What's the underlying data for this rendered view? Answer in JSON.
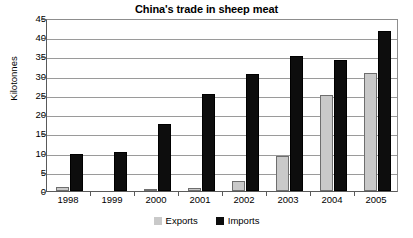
{
  "chart_data": {
    "type": "bar",
    "title": "China's trade in sheep meat",
    "xlabel": "",
    "ylabel": "Kilotonnes",
    "categories": [
      "1998",
      "1999",
      "2000",
      "2001",
      "2002",
      "2003",
      "2004",
      "2005"
    ],
    "series": [
      {
        "name": "Exports",
        "color": "#c9c9c9",
        "values": [
          1.0,
          0.0,
          0.6,
          0.9,
          2.5,
          9.0,
          25.0,
          30.6
        ]
      },
      {
        "name": "Imports",
        "color": "#0d0d0d",
        "values": [
          9.5,
          10.2,
          17.5,
          25.3,
          30.4,
          35.0,
          34.2,
          41.6
        ]
      }
    ],
    "ylim": [
      0,
      45
    ],
    "ytick_step": 5,
    "ytick_labels": [
      "0",
      "5",
      "10",
      "15",
      "20",
      "25",
      "30",
      "35",
      "40",
      "45"
    ],
    "grid": "horizontal",
    "legend_position": "bottom-center"
  }
}
